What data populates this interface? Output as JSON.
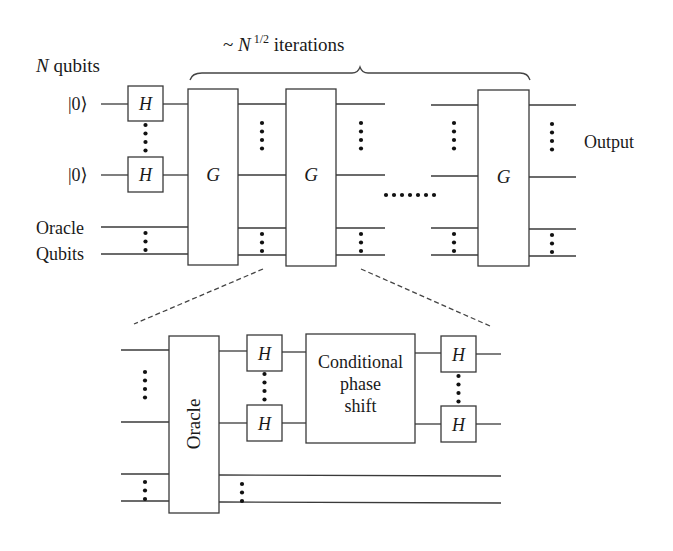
{
  "diagram": {
    "top_circuit": {
      "iterations_label": {
        "prefix": "~ ",
        "variable": "N",
        "exponent": "1/2",
        "suffix": " iterations"
      },
      "qubits_label": {
        "variable": "N",
        "text": " qubits"
      },
      "input_states": [
        "|0⟩",
        "|0⟩"
      ],
      "oracle_qubits_label": [
        "Oracle",
        "Qubits"
      ],
      "hadamard_label": "H",
      "grover_gate_label": "G",
      "grover_gates_shown": 3,
      "output_label": "Output"
    },
    "expanded_iteration": {
      "oracle_label": "Oracle",
      "hadamard_label": "H",
      "phase_shift_label": [
        "Conditional",
        "phase",
        "shift"
      ]
    },
    "colors": {
      "line": "#3a3a3a",
      "text": "#1a1a1a",
      "background": "#ffffff"
    }
  }
}
